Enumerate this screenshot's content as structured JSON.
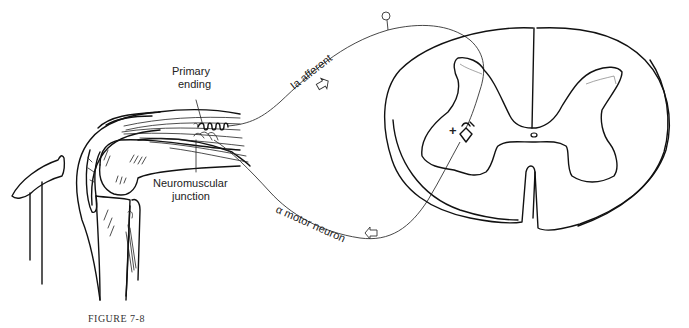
{
  "figure": {
    "caption": "FIGURE 7-8"
  },
  "labels": {
    "primary_ending_line1": "Primary",
    "primary_ending_line2": "ending",
    "nmj_line1": "Neuromuscular",
    "nmj_line2": "junction",
    "ia_afferent": "Ia afferent",
    "alpha_motor_neuron": "α motor neuron",
    "synapse_sign": "+"
  },
  "colors": {
    "ink": "#111111",
    "background": "#ffffff"
  }
}
